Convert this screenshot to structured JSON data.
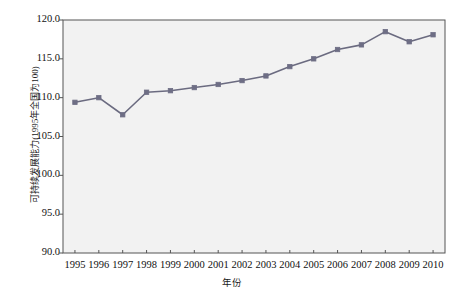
{
  "chart_data": {
    "type": "line",
    "title": "",
    "xlabel": "年份",
    "ylabel": "可持续发展能力(1995年全国为100)",
    "categories": [
      "1995",
      "1996",
      "1997",
      "1998",
      "1999",
      "2000",
      "2001",
      "2002",
      "2003",
      "2004",
      "2005",
      "2006",
      "2007",
      "2008",
      "2009",
      "2010"
    ],
    "values": [
      109.4,
      110.0,
      107.8,
      110.7,
      110.9,
      111.3,
      111.7,
      112.2,
      112.8,
      114.0,
      115.0,
      116.2,
      116.8,
      118.5,
      117.2,
      118.1
    ],
    "series": [
      {
        "name": "可持续发展能力",
        "values": [
          109.4,
          110.0,
          107.8,
          110.7,
          110.9,
          111.3,
          111.7,
          112.2,
          112.8,
          114.0,
          115.0,
          116.2,
          116.8,
          118.5,
          117.2,
          118.1
        ]
      }
    ],
    "ylim": [
      90.0,
      120.0
    ],
    "yticks": [
      "90.0",
      "95.0",
      "100.0",
      "105.0",
      "110.0",
      "115.0",
      "120.0"
    ],
    "ytick_values": [
      90.0,
      95.0,
      100.0,
      105.0,
      110.0,
      115.0,
      120.0
    ],
    "xticks": [
      "1995",
      "1996",
      "1997",
      "1998",
      "1999",
      "2000",
      "2001",
      "2002",
      "2003",
      "2004",
      "2005",
      "2006",
      "2007",
      "2008",
      "2009",
      "2010"
    ],
    "grid": false,
    "legend": "none",
    "marker": "square",
    "line_color": "#6b6b80",
    "marker_color": "#6e6e85",
    "plot_background": "#f2f2f2",
    "frame_color": "#555555"
  }
}
